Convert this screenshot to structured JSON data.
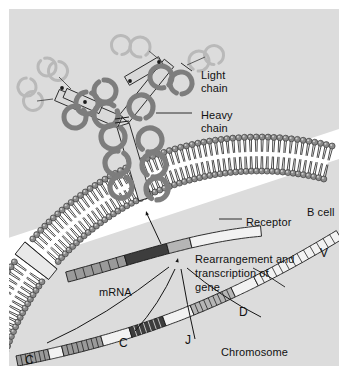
{
  "figure": {
    "panel_background": "#dcdcdc",
    "page_background": "#ffffff"
  },
  "labels": {
    "light_chain": "Light\nchain",
    "heavy_chain": "Heavy\nchain",
    "receptor": "Receptor",
    "b_cell": "B cell",
    "rearrangement": "Rearrangement and\ntranscription of\ngene",
    "mrna": "mRNA",
    "chromosome": "Chromosome",
    "segment_v": "V",
    "segment_d": "D",
    "segment_j": "J",
    "segment_c1": "C",
    "segment_c2": "C"
  },
  "colors": {
    "outline": "#1a1a1a",
    "heavy_chain_fill": "#8c8c8c",
    "light_chain_fill": "#d9d9d9",
    "domain_bar_fill": "#e6e6e6",
    "membrane_head": "#8a8a8a",
    "membrane_head_dark": "#6b6b6b",
    "membrane_interior": "#ffffff",
    "segment_v_fill": "#f2f2f2",
    "segment_d_fill": "#b5b5b5",
    "segment_j_fill": "#3d3d3d",
    "segment_c_fill": "#9a9a9a",
    "spacer_fill": "#f2f2f2",
    "mrna_v_fill": "#f2f2f2",
    "mrna_d_fill": "#b5b5b5",
    "mrna_j_fill": "#3d3d3d",
    "mrna_c_fill": "#9a9a9a",
    "text": "#111111"
  },
  "structures": {
    "antibody": {
      "name": "Y-shaped membrane immunoglobulin",
      "heavy_chains": 2,
      "light_chains": 2,
      "domains_per_heavy_chain": 4,
      "domains_per_light_chain": 2
    },
    "membrane": {
      "name": "phospholipid bilayer",
      "leaflets": 2,
      "receptor_gap": true
    },
    "mrna_segments": [
      "V",
      "D",
      "J",
      "C"
    ],
    "chromosome_segments": [
      "V",
      "D",
      "J",
      "C",
      "C"
    ],
    "arrows": {
      "mrna_to_membrane": 1,
      "chromosome_to_mrna": 4
    }
  }
}
